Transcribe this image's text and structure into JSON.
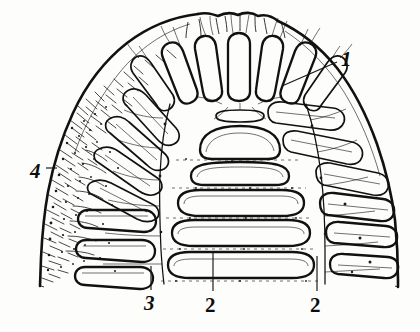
{
  "figure": {
    "kind": "scientific-line-drawing",
    "background_color": "#fdfdfc",
    "ink_color": "#121110",
    "callouts": [
      {
        "id": "callout-1",
        "label": "1",
        "style": "italic",
        "x": 341,
        "y": 66,
        "leader": {
          "x1": 337,
          "y1": 62,
          "x2": 282,
          "y2": 86
        }
      },
      {
        "id": "callout-2-center",
        "label": "2",
        "style": "upright",
        "x": 205,
        "y": 312,
        "leader": {
          "x1": 213,
          "y1": 291,
          "x2": 213,
          "y2": 253
        }
      },
      {
        "id": "callout-2-right",
        "label": "2",
        "style": "upright",
        "x": 310,
        "y": 312,
        "leader": {
          "x1": 317,
          "y1": 291,
          "x2": 317,
          "y2": 256
        }
      },
      {
        "id": "callout-3",
        "label": "3",
        "style": "italic",
        "x": 144,
        "y": 310,
        "leader": {
          "x1": 151,
          "y1": 290,
          "x2": 151,
          "y2": 266
        }
      },
      {
        "id": "callout-4",
        "label": "4",
        "style": "italic",
        "x": 30,
        "y": 178,
        "leader": {
          "x1": 46,
          "y1": 168,
          "x2": 56,
          "y2": 168
        }
      }
    ]
  }
}
